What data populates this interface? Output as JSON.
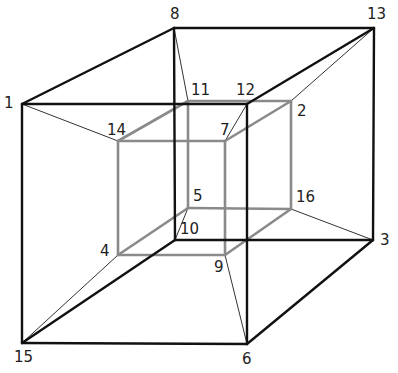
{
  "diagram": {
    "title": "",
    "type": "tesseract-projection",
    "colors": {
      "outer": "#111111",
      "inner": "#8a8a8a",
      "connector": "#333333"
    },
    "vertices": [
      {
        "id": "1",
        "x": 22,
        "y": 104,
        "lx": 4,
        "ly": 96
      },
      {
        "id": "2",
        "x": 291,
        "y": 101,
        "lx": 297,
        "ly": 104
      },
      {
        "id": "3",
        "x": 373,
        "y": 240,
        "lx": 380,
        "ly": 233
      },
      {
        "id": "4",
        "x": 118,
        "y": 255,
        "lx": 100,
        "ly": 244
      },
      {
        "id": "5",
        "x": 188,
        "y": 208,
        "lx": 193,
        "ly": 189
      },
      {
        "id": "6",
        "x": 247,
        "y": 344,
        "lx": 242,
        "ly": 352
      },
      {
        "id": "7",
        "x": 225,
        "y": 141,
        "lx": 220,
        "ly": 123
      },
      {
        "id": "8",
        "x": 174,
        "y": 28,
        "lx": 170,
        "ly": 7
      },
      {
        "id": "9",
        "x": 225,
        "y": 255,
        "lx": 214,
        "ly": 260
      },
      {
        "id": "10",
        "x": 175,
        "y": 240,
        "lx": 180,
        "ly": 222
      },
      {
        "id": "11",
        "x": 188,
        "y": 101,
        "lx": 191,
        "ly": 83
      },
      {
        "id": "12",
        "x": 247,
        "y": 104,
        "lx": 236,
        "ly": 83
      },
      {
        "id": "13",
        "x": 374,
        "y": 28,
        "lx": 367,
        "ly": 7
      },
      {
        "id": "14",
        "x": 118,
        "y": 141,
        "lx": 107,
        "ly": 123
      },
      {
        "id": "15",
        "x": 22,
        "y": 343,
        "lx": 14,
        "ly": 350
      },
      {
        "id": "16",
        "x": 291,
        "y": 209,
        "lx": 296,
        "ly": 190
      }
    ],
    "outer_edges": [
      [
        "8",
        "13"
      ],
      [
        "1",
        "12"
      ],
      [
        "15",
        "6"
      ],
      [
        "10",
        "3"
      ],
      [
        "8",
        "10"
      ],
      [
        "13",
        "3"
      ],
      [
        "1",
        "15"
      ],
      [
        "12",
        "6"
      ],
      [
        "1",
        "8"
      ],
      [
        "12",
        "13"
      ],
      [
        "15",
        "10"
      ],
      [
        "6",
        "3"
      ]
    ],
    "inner_edges": [
      [
        "11",
        "2"
      ],
      [
        "14",
        "7"
      ],
      [
        "4",
        "9"
      ],
      [
        "5",
        "16"
      ],
      [
        "11",
        "5"
      ],
      [
        "2",
        "16"
      ],
      [
        "14",
        "4"
      ],
      [
        "7",
        "9"
      ],
      [
        "14",
        "11"
      ],
      [
        "7",
        "2"
      ],
      [
        "4",
        "5"
      ],
      [
        "9",
        "16"
      ]
    ],
    "connectors": [
      [
        "1",
        "14"
      ],
      [
        "8",
        "11"
      ],
      [
        "13",
        "2"
      ],
      [
        "12",
        "7"
      ],
      [
        "15",
        "4"
      ],
      [
        "10",
        "5"
      ],
      [
        "3",
        "16"
      ],
      [
        "6",
        "9"
      ]
    ]
  }
}
